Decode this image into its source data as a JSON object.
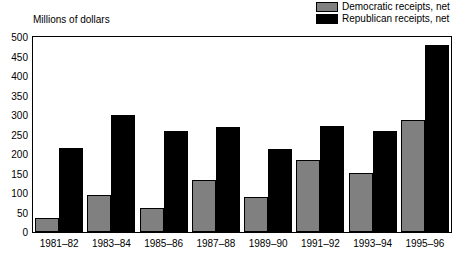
{
  "legend": {
    "items": [
      {
        "label": "Democratic receipts, net",
        "color": "#808080",
        "swatch_icon": "legend-swatch-gray"
      },
      {
        "label": "Republican receipts, net",
        "color": "#000000",
        "swatch_icon": "legend-swatch-black"
      }
    ]
  },
  "chart_data": {
    "type": "bar",
    "title": "",
    "subtitle": "",
    "xlabel": "",
    "ylabel": "Millions of dollars",
    "ylim": [
      0,
      500
    ],
    "ytick_step": 50,
    "yticks": [
      0,
      50,
      100,
      150,
      200,
      250,
      300,
      350,
      400,
      450,
      500
    ],
    "ytick_labels": [
      "0",
      "50",
      "100",
      "150",
      "200",
      "250",
      "300",
      "350",
      "400",
      "450",
      "500"
    ],
    "grid": false,
    "legend_position": "top-right",
    "categories": [
      "1981–82",
      "1983–84",
      "1985–86",
      "1987–88",
      "1989–90",
      "1991–92",
      "1993–94",
      "1995–96"
    ],
    "series": [
      {
        "name": "Democratic receipts, net",
        "color": "#808080",
        "values": [
          35,
          95,
          62,
          133,
          90,
          185,
          152,
          287
        ]
      },
      {
        "name": "Republican receipts, net",
        "color": "#000000",
        "values": [
          215,
          300,
          258,
          268,
          212,
          272,
          260,
          480
        ]
      }
    ]
  }
}
